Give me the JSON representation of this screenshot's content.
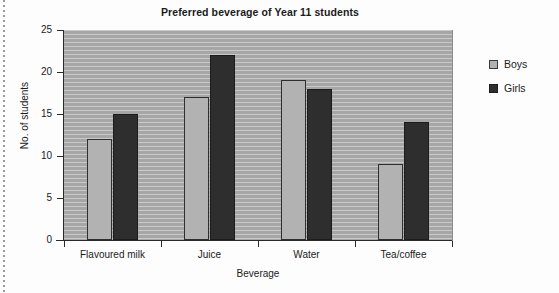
{
  "chart_data": {
    "type": "bar",
    "title": "Preferred beverage of Year 11 students",
    "xlabel": "Beverage",
    "ylabel": "No. of students",
    "categories": [
      "Flavoured milk",
      "Juice",
      "Water",
      "Tea/coffee"
    ],
    "series": [
      {
        "name": "Boys",
        "color": "#b2b2b2",
        "values": [
          12,
          17,
          19,
          9
        ]
      },
      {
        "name": "Girls",
        "color": "#2e2e2e",
        "values": [
          15,
          22,
          18,
          14
        ]
      }
    ],
    "ylim": [
      0,
      25
    ],
    "ytick_labels": [
      "25",
      "20",
      "15",
      "10",
      "5",
      "0"
    ],
    "ytick_values": [
      25,
      20,
      15,
      10,
      5,
      0
    ],
    "ytick_step": 5,
    "grid": true,
    "grid_orientation": "horizontal",
    "legend_position": "right",
    "plot_background": "#a9a9a9",
    "gridline_color": "#c9c9c9",
    "axis_color": "#2a2a2a"
  },
  "legend": {
    "items": [
      {
        "label": "Boys"
      },
      {
        "label": "Girls"
      }
    ]
  }
}
